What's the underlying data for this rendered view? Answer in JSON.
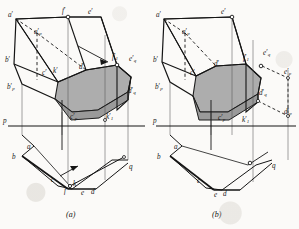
{
  "figure": {
    "background_color": "#fbfaf8",
    "line_color": "#1a1a1a",
    "section_fill": "#a9a9a9",
    "section_fill_light": "#bdbdbd",
    "hidden_line_style": "dashed"
  },
  "captions": {
    "a": "(a)",
    "b": "(b)"
  },
  "panel_a": {
    "axis_labels": {
      "p": "p",
      "q": "q"
    },
    "elevation_labels": [
      {
        "id": "a-prime",
        "text": "a",
        "prime": "′",
        "sub": "",
        "x": 8,
        "y": 12
      },
      {
        "id": "a-prime-p",
        "text": "a",
        "prime": "′",
        "sub": "p",
        "x": 34,
        "y": 29
      },
      {
        "id": "f-prime",
        "text": "f",
        "prime": "′",
        "sub": "",
        "x": 62,
        "y": 10
      },
      {
        "id": "e-prime",
        "text": "e",
        "prime": "′",
        "sub": "",
        "x": 88,
        "y": 12
      },
      {
        "id": "b-prime",
        "text": "b",
        "prime": "′",
        "sub": "",
        "x": 7,
        "y": 59
      },
      {
        "id": "b-prime-p",
        "text": "b",
        "prime": "′",
        "sub": "p",
        "x": 9,
        "y": 84
      },
      {
        "id": "c-prime",
        "text": "c",
        "prime": "′",
        "sub": "",
        "x": 43,
        "y": 70
      },
      {
        "id": "k-prime",
        "text": "k",
        "prime": "′",
        "sub": "",
        "x": 53,
        "y": 68
      },
      {
        "id": "d-prime",
        "text": "d",
        "prime": "′",
        "sub": "",
        "x": 79,
        "y": 66
      },
      {
        "id": "f-prime-1",
        "text": "f",
        "prime": "′",
        "sub": "1",
        "x": 113,
        "y": 55
      },
      {
        "id": "e-prime-q",
        "text": "e",
        "prime": "′",
        "sub": "q",
        "x": 130,
        "y": 57
      },
      {
        "id": "d-prime-q",
        "text": "d",
        "prime": "′",
        "sub": "q",
        "x": 128,
        "y": 90
      },
      {
        "id": "c-prime-p",
        "text": "c",
        "prime": "′",
        "sub": "p",
        "x": 72,
        "y": 117
      },
      {
        "id": "k-prime-1",
        "text": "k",
        "prime": "′",
        "sub": "1",
        "x": 108,
        "y": 117
      }
    ],
    "plan_labels": [
      {
        "id": "plan-a",
        "text": "a",
        "x": 27,
        "y": 148
      },
      {
        "id": "plan-b",
        "text": "b",
        "x": 14,
        "y": 157
      },
      {
        "id": "plan-c",
        "text": "c",
        "x": 52,
        "y": 180
      },
      {
        "id": "plan-f",
        "text": "f",
        "x": 65,
        "y": 188
      },
      {
        "id": "plan-k",
        "text": "k",
        "x": 74,
        "y": 183
      },
      {
        "id": "plan-e",
        "text": "e",
        "x": 82,
        "y": 192
      },
      {
        "id": "plan-d",
        "text": "d",
        "x": 92,
        "y": 191
      },
      {
        "id": "plan-q",
        "text": "q",
        "x": 129,
        "y": 167
      }
    ],
    "ground_line_label": {
      "id": "axis-p",
      "text": "p",
      "x": 4,
      "y": 117
    }
  },
  "panel_b": {
    "axis_labels": {
      "p": "p",
      "q": "q"
    },
    "elevation_labels": [
      {
        "id": "a-prime",
        "text": "a",
        "prime": "′",
        "sub": "",
        "x": 156,
        "y": 12
      },
      {
        "id": "a-prime-p",
        "text": "a",
        "prime": "′",
        "sub": "p",
        "x": 182,
        "y": 29
      },
      {
        "id": "e-prime",
        "text": "e",
        "prime": "′",
        "sub": "",
        "x": 222,
        "y": 12
      },
      {
        "id": "b-prime",
        "text": "b",
        "prime": "′",
        "sub": "",
        "x": 155,
        "y": 59
      },
      {
        "id": "b-prime-p",
        "text": "b",
        "prime": "′",
        "sub": "p",
        "x": 157,
        "y": 84
      },
      {
        "id": "c-prime",
        "text": "c",
        "prime": "′",
        "sub": "",
        "x": 191,
        "y": 72
      },
      {
        "id": "d-prime",
        "text": "d",
        "prime": "′",
        "sub": "",
        "x": 216,
        "y": 62
      },
      {
        "id": "f-prime-1",
        "text": "f",
        "prime": "′",
        "sub": "1",
        "x": 244,
        "y": 57
      },
      {
        "id": "e-prime-q",
        "text": "e",
        "prime": "′",
        "sub": "q",
        "x": 264,
        "y": 52
      },
      {
        "id": "e-prime-p",
        "text": "e",
        "prime": "′",
        "sub": "p",
        "x": 285,
        "y": 71
      },
      {
        "id": "d-prime-q",
        "text": "d",
        "prime": "′",
        "sub": "q",
        "x": 260,
        "y": 93
      },
      {
        "id": "d-prime-p",
        "text": "d",
        "prime": "′",
        "sub": "p",
        "x": 285,
        "y": 112
      },
      {
        "id": "c-prime-p",
        "text": "c",
        "prime": "′",
        "sub": "p",
        "x": 220,
        "y": 118
      },
      {
        "id": "k-prime-1",
        "text": "k",
        "prime": "′",
        "sub": "1",
        "x": 243,
        "y": 120
      }
    ],
    "plan_labels": [
      {
        "id": "plan-a",
        "text": "a",
        "x": 174,
        "y": 148
      },
      {
        "id": "plan-b",
        "text": "b",
        "x": 159,
        "y": 157
      },
      {
        "id": "plan-c",
        "text": "c",
        "x": 198,
        "y": 181
      },
      {
        "id": "plan-e",
        "text": "e",
        "x": 215,
        "y": 195
      },
      {
        "id": "plan-d",
        "text": "d",
        "x": 224,
        "y": 194
      },
      {
        "id": "plan-q",
        "text": "q",
        "x": 274,
        "y": 166
      }
    ],
    "ground_line_label": {
      "id": "axis-p",
      "text": "p",
      "x": 154,
      "y": 118
    }
  }
}
